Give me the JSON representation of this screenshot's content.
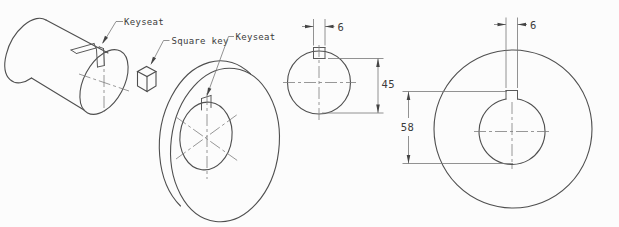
{
  "drawing": {
    "title": "Keyseat and square key technical drawing",
    "colors": {
      "background": "#fcfcfc",
      "object_line": "#4f4f4f",
      "thin_line": "#767676",
      "text": "#3b3b3b"
    },
    "pictorial": {
      "shaft_keyseat_label": "Keyseat",
      "square_key_label": "Square key",
      "hub_keyseat_label": "Keyseat"
    },
    "shaft_end_view": {
      "key_width": "6",
      "keyseat_to_opposite_side": "45"
    },
    "hub_end_view": {
      "key_width": "6",
      "keyseat_to_bore_bottom": "58"
    }
  }
}
